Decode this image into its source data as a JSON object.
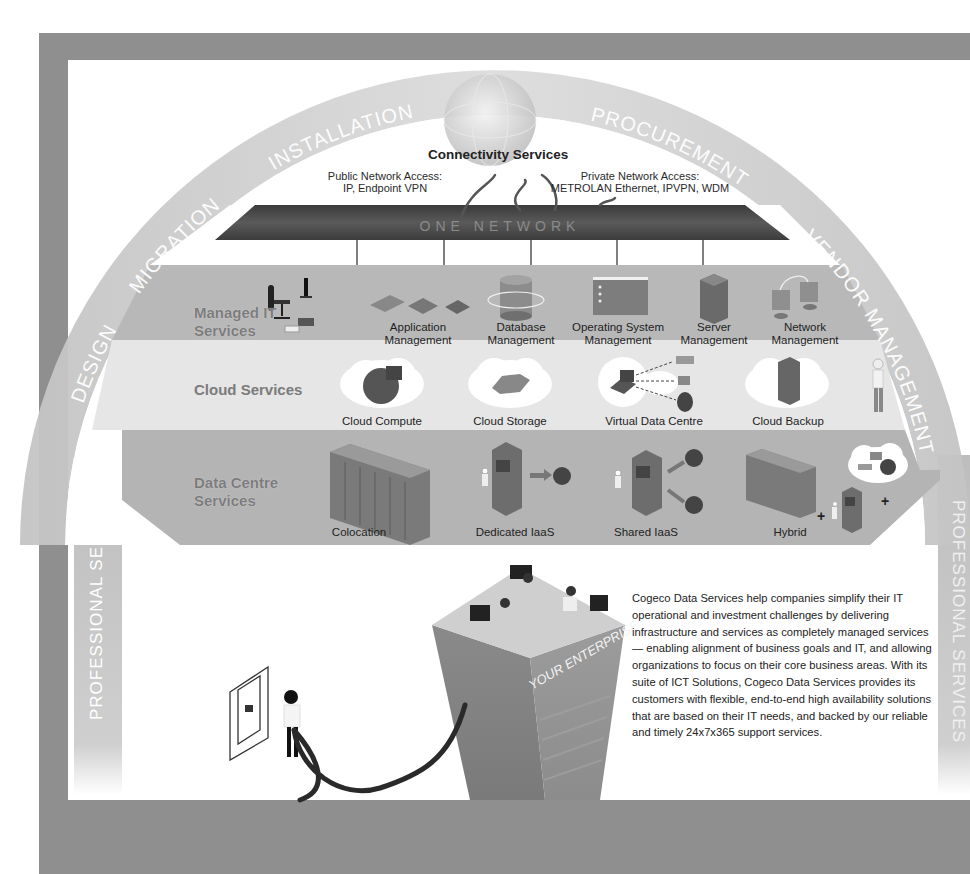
{
  "arc": {
    "segments": [
      "DESIGN",
      "MIGRATION",
      "INSTALLATION",
      "PROCUREMENT",
      "VENDOR MANAGEMENT"
    ]
  },
  "side_bars": {
    "left": "PROFESSIONAL SERVICES",
    "right": "PROFESSIONAL SERVICES"
  },
  "connectivity": {
    "title": "Connectivity Services",
    "public": {
      "line1": "Public Network Access:",
      "line2": "IP, Endpoint VPN"
    },
    "private": {
      "line1": "Private Network Access:",
      "line2": "METROLAN Ethernet, IPVPN, WDM"
    },
    "network_bar": "ONE NETWORK"
  },
  "bands": [
    {
      "label_line1": "Managed IT",
      "label_line2": "Services",
      "items": [
        {
          "line1": "Application",
          "line2": "Management",
          "icon": "application-tablets-icon"
        },
        {
          "line1": "Database",
          "line2": "Management",
          "icon": "database-icon"
        },
        {
          "line1": "Operating System",
          "line2": "Management",
          "icon": "os-window-icon"
        },
        {
          "line1": "Server",
          "line2": "Management",
          "icon": "server-tower-icon"
        },
        {
          "line1": "Network",
          "line2": "Management",
          "icon": "network-monitors-icon"
        }
      ]
    },
    {
      "label_line1": "Cloud Services",
      "label_line2": "",
      "items": [
        {
          "line1": "Cloud Compute",
          "icon": "cloud-compute-icon"
        },
        {
          "line1": "Cloud Storage",
          "icon": "cloud-storage-icon"
        },
        {
          "line1": "Virtual Data Centre",
          "icon": "virtual-data-centre-icon"
        },
        {
          "line1": "Cloud Backup",
          "icon": "cloud-backup-icon"
        }
      ]
    },
    {
      "label_line1": "Data Centre",
      "label_line2": "Services",
      "items": [
        {
          "line1": "Colocation",
          "icon": "server-racks-icon"
        },
        {
          "line1": "Dedicated IaaS",
          "icon": "dedicated-server-icon"
        },
        {
          "line1": "Shared IaaS",
          "icon": "shared-server-icon"
        },
        {
          "line1": "Hybrid",
          "icon": "hybrid-icon"
        }
      ],
      "plus_sign": "+"
    }
  ],
  "enterprise": {
    "label": "YOUR ENTERPRISE"
  },
  "description": "Cogeco Data Services help companies simplify their IT operational and investment challenges by delivering infrastructure and services as completely managed services — enabling alignment of business goals and IT, and allowing organizations to focus on their core business areas. With its suite of ICT Solutions, Cogeco Data Services provides its customers with flexible, end-to-end high availability solutions that are based on their IT needs, and backed by our reliable and timely 24x7x365 support services.",
  "colors": {
    "frame": "#8f8f8f",
    "arc": "#c9c9c9",
    "network_bar": "#4a4a4a",
    "band_dark": "#b5b5b5",
    "band_light": "#e4e4e4",
    "band_label": "#7c7c7c"
  }
}
